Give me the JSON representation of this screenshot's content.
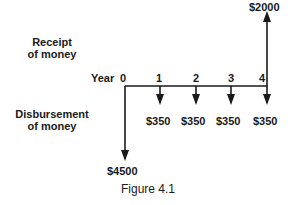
{
  "labels": {
    "receipt": [
      "Receipt",
      "of money"
    ],
    "disbursement": [
      "Disbursement",
      "of money"
    ],
    "year_prefix": "Year"
  },
  "timeline": {
    "years": [
      "0",
      "1",
      "2",
      "3",
      "4"
    ]
  },
  "cash_flows": {
    "receipts": [
      {
        "year": 4,
        "amount": "$2000"
      }
    ],
    "disbursements": [
      {
        "year": 0,
        "amount": "$4500"
      },
      {
        "year": 1,
        "amount": "$350"
      },
      {
        "year": 2,
        "amount": "$350"
      },
      {
        "year": 3,
        "amount": "$350"
      },
      {
        "year": 4,
        "amount": "$350"
      }
    ]
  },
  "caption": "Figure 4.1",
  "colors": {
    "ink": "#1a1a1a",
    "background": "#ffffff"
  }
}
